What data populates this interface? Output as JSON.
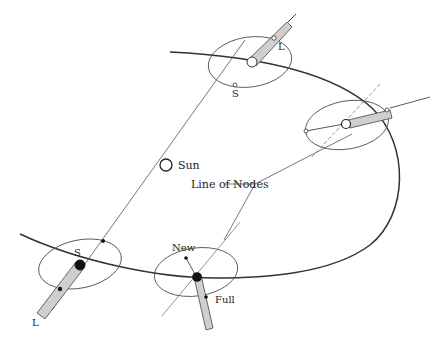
{
  "diagram": {
    "labels": {
      "sun": "Sun",
      "line_of_nodes": "Line of Nodes",
      "new": "New",
      "full": "Full",
      "s_top": "S",
      "l_top": "L",
      "s_left": "S",
      "l_left": "L"
    },
    "positions": [
      {
        "name": "top",
        "phase_labels": [
          "S",
          "L"
        ],
        "eclipse_possible": true
      },
      {
        "name": "right",
        "phase_labels": [],
        "eclipse_possible": false
      },
      {
        "name": "bottom-center",
        "phase_labels": [
          "New",
          "Full"
        ],
        "eclipse_possible": false
      },
      {
        "name": "left",
        "phase_labels": [
          "S",
          "L"
        ],
        "eclipse_possible": true
      }
    ],
    "colors": {
      "stroke": "#333333",
      "thin": "#555555",
      "shadow_fill": "#cfcfcf",
      "earth_dark": "#111111"
    }
  }
}
